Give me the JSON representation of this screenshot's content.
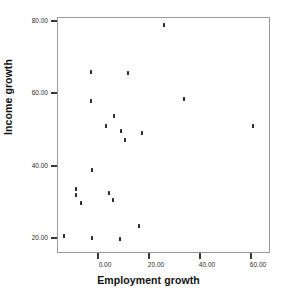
{
  "chart_data": {
    "type": "scatter",
    "title": "",
    "xlabel": "Employment growth",
    "ylabel": "Income growth",
    "xlim": [
      -15.0,
      65.0
    ],
    "ylim": [
      15.0,
      82.0
    ],
    "grid": false,
    "legend": null,
    "xticks": [
      {
        "value": 0.0,
        "label": "0.00"
      },
      {
        "value": 20.0,
        "label": "20.00"
      },
      {
        "value": 40.0,
        "label": "40.00"
      },
      {
        "value": 60.0,
        "label": "60.00"
      }
    ],
    "yticks": [
      {
        "value": 20.0,
        "label": "20.00"
      },
      {
        "value": 40.0,
        "label": "40.00"
      },
      {
        "value": 60.0,
        "label": "60.00"
      },
      {
        "value": 80.0,
        "label": "80.00"
      }
    ],
    "marker": "small-dark-dot",
    "marker_color": "#2b2b2b",
    "series": [
      {
        "name": "observations",
        "points": [
          {
            "x": 26.0,
            "y": 78.9
          },
          {
            "x": -2.6,
            "y": 65.8
          },
          {
            "x": 11.8,
            "y": 65.7
          },
          {
            "x": -2.9,
            "y": 58.0
          },
          {
            "x": 34.0,
            "y": 58.4
          },
          {
            "x": 61.2,
            "y": 51.1
          },
          {
            "x": 6.4,
            "y": 53.6
          },
          {
            "x": 3.0,
            "y": 51.0
          },
          {
            "x": 9.0,
            "y": 49.7
          },
          {
            "x": 17.3,
            "y": 49.1
          },
          {
            "x": 10.6,
            "y": 47.1
          },
          {
            "x": -2.3,
            "y": 38.8
          },
          {
            "x": -8.5,
            "y": 33.6
          },
          {
            "x": -8.5,
            "y": 32.0
          },
          {
            "x": 4.5,
            "y": 32.4
          },
          {
            "x": -6.5,
            "y": 29.7
          },
          {
            "x": 6.0,
            "y": 30.4
          },
          {
            "x": 16.0,
            "y": 23.3
          },
          {
            "x": -13.5,
            "y": 20.5
          },
          {
            "x": -2.4,
            "y": 20.0
          },
          {
            "x": 8.6,
            "y": 19.8
          }
        ]
      }
    ]
  },
  "axes": {
    "frame_color": "#9a9a9a",
    "tick_color": "#3a3a3a"
  }
}
